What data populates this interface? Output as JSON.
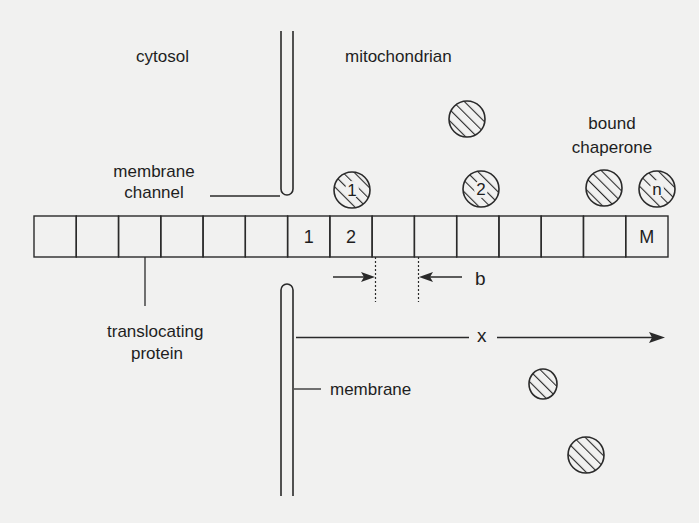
{
  "labels": {
    "cytosol": "cytosol",
    "mitochondrian": "mitochondrian",
    "membrane_channel_1": "membrane",
    "membrane_channel_2": "channel",
    "bound_1": "bound",
    "bound_2": "chaperone",
    "translocating_1": "translocating",
    "translocating_2": "protein",
    "membrane": "membrane",
    "b": "b",
    "x": "x"
  },
  "protein_chain": {
    "segment_count": 15,
    "segments": [
      "",
      "",
      "",
      "",
      "",
      "",
      "1",
      "2",
      "",
      "",
      "",
      "",
      "",
      "",
      "M"
    ]
  },
  "chaperones": {
    "bound": [
      {
        "label": "1",
        "cx": 352,
        "cy": 190
      },
      {
        "label": "2",
        "cx": 481,
        "cy": 189
      },
      {
        "label": "",
        "cx": 604,
        "cy": 188
      },
      {
        "label": "n",
        "cx": 657,
        "cy": 189
      }
    ],
    "free": [
      {
        "label": "",
        "cx": 467,
        "cy": 119
      },
      {
        "label": "",
        "cx": 543,
        "cy": 384
      },
      {
        "label": "",
        "cx": 586,
        "cy": 455
      }
    ]
  },
  "colors": {
    "background": "#f1f1f0",
    "stroke": "#2a2a2a"
  }
}
